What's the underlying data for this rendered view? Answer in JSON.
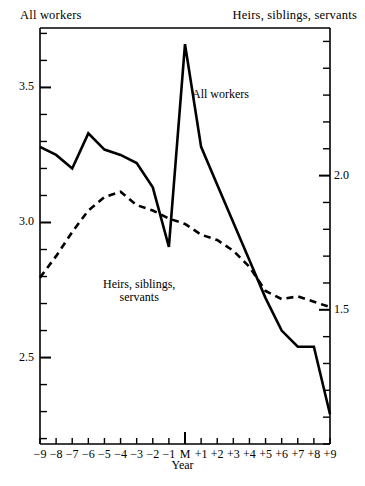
{
  "header": {
    "left_axis_title": "All workers",
    "right_axis_title": "Heirs, siblings, servants"
  },
  "annotations": {
    "all_workers": "All workers",
    "heirs_line1": "Heirs, siblings,",
    "heirs_line2": "servants"
  },
  "chart_data": {
    "type": "line",
    "title": "",
    "xlabel": "Year",
    "ylabel": "All workers",
    "y2label": "Heirs, siblings, servants",
    "grid": false,
    "legend_position": "inline-annotations",
    "categories": [
      "-9",
      "-8",
      "-7",
      "-6",
      "-5",
      "-4",
      "-3",
      "-2",
      "-1",
      "M",
      "+1",
      "+2",
      "+3",
      "+4",
      "+5",
      "+6",
      "+7",
      "+8",
      "+9"
    ],
    "x_tick_labels": [
      "−9",
      "−8",
      "−7",
      "−6",
      "−5",
      "−4",
      "−3",
      "−2",
      "−1",
      "M",
      "+1",
      "+2",
      "+3",
      "+4",
      "+5",
      "+6",
      "+7",
      "+8",
      "+9"
    ],
    "left_axis": {
      "ticks": [
        2.5,
        3.0,
        3.5
      ],
      "tick_labels": [
        "2.5",
        "3.0",
        "3.5"
      ],
      "ylim": [
        2.18,
        3.72
      ],
      "minor_tick_step": 0.1
    },
    "right_axis": {
      "ticks": [
        1.5,
        2.0
      ],
      "tick_labels": [
        "1.5",
        "2.0"
      ],
      "ylim": [
        1.0,
        2.55
      ],
      "minor_tick_step": 0.1
    },
    "series": [
      {
        "name": "All workers",
        "style": "solid",
        "axis": "left",
        "values": [
          3.28,
          3.25,
          3.2,
          3.33,
          3.27,
          3.25,
          3.22,
          3.13,
          2.91,
          3.66,
          3.28,
          3.14,
          3.0,
          2.86,
          2.72,
          2.6,
          2.54,
          2.54,
          2.29
        ]
      },
      {
        "name": "Heirs, siblings, servants",
        "style": "dashed",
        "axis": "right",
        "values": [
          1.62,
          1.7,
          1.79,
          1.87,
          1.92,
          1.94,
          1.89,
          1.87,
          1.84,
          1.82,
          1.78,
          1.76,
          1.72,
          1.66,
          1.57,
          1.54,
          1.55,
          1.53,
          1.51
        ]
      }
    ]
  }
}
